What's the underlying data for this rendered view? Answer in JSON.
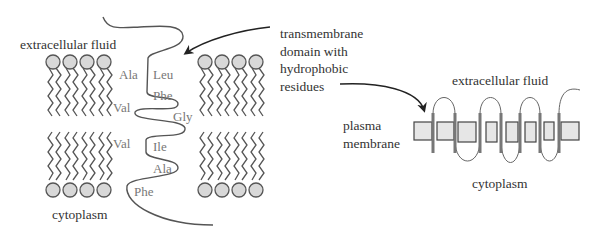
{
  "left_panel": {
    "top_label": "extracellular fluid",
    "bottom_label": "cytoplasm",
    "residues_left": [
      "Ala",
      "Val",
      "Val"
    ],
    "residues_right": [
      "Leu",
      "Phe",
      "Gly",
      "Ile",
      "Ala",
      "Phe"
    ]
  },
  "callout": {
    "lines": [
      "transmembrane",
      "domain with",
      "hydrophobic",
      "residues"
    ]
  },
  "right_panel": {
    "top_label": "extracellular fluid",
    "bottom_label": "cytoplasm",
    "membrane_label_lines": [
      "plasma",
      "membrane"
    ]
  },
  "colors": {
    "text": "#333333",
    "residue_text": "#777777",
    "line": "#555555",
    "head_fill": "#d8d8d8",
    "box_fill": "#e6e6e6",
    "helix_fill": "#777777"
  }
}
